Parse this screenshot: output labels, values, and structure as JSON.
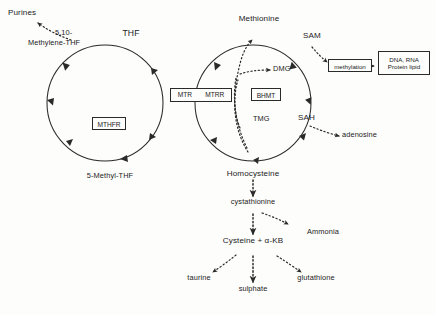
{
  "diagram": {
    "background_color": "#fdfdfb",
    "stroke_color": "#2a2a2a",
    "text_color": "#1b1b1b"
  },
  "nodes": {
    "purines": "Purines",
    "methylene_thf_line1": "5,10-",
    "methylene_thf_line2": "Methylene-THF",
    "thf": "THF",
    "methyl_thf": "5-Methyl-THF",
    "methionine": "Methionine",
    "sam": "SAM",
    "sah": "SAH",
    "dmg": "DMG",
    "tmg": "TMG",
    "adenosine": "adenosine",
    "homocysteine": "Homocysteine",
    "cystathionine": "cystathionine",
    "ammonia": "Ammonia",
    "cysteine_akb": "Cysteine + α-KB",
    "taurine": "taurine",
    "sulphate": "sulphate",
    "glutathione": "glutathione"
  },
  "enzyme_boxes": {
    "mthfr": "MTHFR",
    "mtr": "MTR",
    "mtrr": "MTRR",
    "bhmt": "BHMT"
  },
  "process_boxes": {
    "methylation": "methylation",
    "targets_line1": "DNA, RNA",
    "targets_line2": "Protein lipid"
  },
  "cycles": {
    "folate_cycle": {
      "name": "folate cycle",
      "center_x": 105,
      "center_y": 103,
      "radius": 58,
      "members": [
        "THF",
        "5,10-Methylene-THF",
        "5-Methyl-THF"
      ],
      "enzymes": [
        "MTHFR",
        "MTR",
        "MTRR"
      ]
    },
    "methionine_cycle": {
      "name": "methionine cycle",
      "center_x": 253,
      "center_y": 103,
      "radius": 58,
      "members": [
        "Methionine",
        "SAM",
        "SAH",
        "Homocysteine"
      ],
      "enzymes": [
        "MTR",
        "MTRR",
        "BHMT"
      ]
    }
  },
  "edges": [
    {
      "from": "5,10-Methylene-THF",
      "to": "Purines",
      "style": "dotted"
    },
    {
      "from": "SAM",
      "to": "methylation",
      "style": "dotted"
    },
    {
      "from": "methylation",
      "to": "DNA, RNA Protein lipid",
      "style": "solid"
    },
    {
      "from": "SAH",
      "to": "adenosine",
      "style": "dotted"
    },
    {
      "from": "BHMT",
      "to": "DMG",
      "style": "dotted"
    },
    {
      "from": "TMG",
      "to": "Methionine",
      "style": "dotted"
    },
    {
      "from": "Homocysteine",
      "to": "cystathionine",
      "style": "dotted"
    },
    {
      "from": "cystathionine",
      "to": "Ammonia",
      "style": "dotted"
    },
    {
      "from": "cystathionine",
      "to": "Cysteine + α-KB",
      "style": "dotted"
    },
    {
      "from": "Cysteine + α-KB",
      "to": "taurine",
      "style": "dotted"
    },
    {
      "from": "Cysteine + α-KB",
      "to": "sulphate",
      "style": "dotted"
    },
    {
      "from": "Cysteine + α-KB",
      "to": "glutathione",
      "style": "dotted"
    }
  ]
}
